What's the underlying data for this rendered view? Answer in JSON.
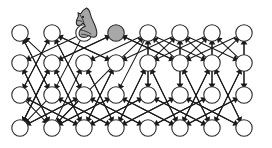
{
  "figure": {
    "name": "knight-move-graph",
    "width": 272,
    "height": 148,
    "background": "#ffffff"
  },
  "style": {
    "node_stroke": "#2a2a2a",
    "node_empty_fill": "#ffffff",
    "node_filled_fill": "#a8a8a8",
    "edge_color": "#1a1a1a",
    "piece_fill": "#a6a6a6",
    "piece_stroke": "#262626",
    "node_radius": 8.2,
    "edge_width": 1.05
  },
  "grid": {
    "columns": 8,
    "rows": 4,
    "col_x": [
      20,
      52,
      84,
      116,
      148,
      180,
      212,
      244
    ],
    "row_y": [
      33,
      63,
      95,
      128
    ]
  },
  "nodes": [
    {
      "id": "r0c0",
      "label": "",
      "col": 0,
      "row": 0,
      "cx": 20,
      "cy": 33,
      "state": "empty"
    },
    {
      "id": "r0c1",
      "label": "",
      "col": 1,
      "row": 0,
      "cx": 52,
      "cy": 33,
      "state": "empty"
    },
    {
      "id": "r0c2",
      "label": "",
      "col": 2,
      "row": 0,
      "cx": 84,
      "cy": 33,
      "state": "occupied-by-piece"
    },
    {
      "id": "r0c3",
      "label": "",
      "col": 3,
      "row": 0,
      "cx": 116,
      "cy": 33,
      "state": "filled"
    },
    {
      "id": "r0c4",
      "label": "",
      "col": 4,
      "row": 0,
      "cx": 148,
      "cy": 33,
      "state": "empty"
    },
    {
      "id": "r0c5",
      "label": "",
      "col": 5,
      "row": 0,
      "cx": 180,
      "cy": 33,
      "state": "empty"
    },
    {
      "id": "r0c6",
      "label": "",
      "col": 6,
      "row": 0,
      "cx": 212,
      "cy": 33,
      "state": "empty"
    },
    {
      "id": "r0c7",
      "label": "",
      "col": 7,
      "row": 0,
      "cx": 244,
      "cy": 33,
      "state": "empty"
    },
    {
      "id": "r1c0",
      "label": "",
      "col": 0,
      "row": 1,
      "cx": 20,
      "cy": 63,
      "state": "empty"
    },
    {
      "id": "r1c1",
      "label": "",
      "col": 1,
      "row": 1,
      "cx": 52,
      "cy": 63,
      "state": "empty"
    },
    {
      "id": "r1c2",
      "label": "",
      "col": 2,
      "row": 1,
      "cx": 84,
      "cy": 63,
      "state": "empty"
    },
    {
      "id": "r1c3",
      "label": "",
      "col": 3,
      "row": 1,
      "cx": 116,
      "cy": 63,
      "state": "empty"
    },
    {
      "id": "r1c4",
      "label": "",
      "col": 4,
      "row": 1,
      "cx": 148,
      "cy": 63,
      "state": "empty"
    },
    {
      "id": "r1c5",
      "label": "",
      "col": 5,
      "row": 1,
      "cx": 180,
      "cy": 63,
      "state": "empty"
    },
    {
      "id": "r1c6",
      "label": "",
      "col": 6,
      "row": 1,
      "cx": 212,
      "cy": 63,
      "state": "empty"
    },
    {
      "id": "r1c7",
      "label": "",
      "col": 7,
      "row": 1,
      "cx": 244,
      "cy": 63,
      "state": "empty"
    },
    {
      "id": "r2c0",
      "label": "",
      "col": 0,
      "row": 2,
      "cx": 20,
      "cy": 95,
      "state": "empty"
    },
    {
      "id": "r2c1",
      "label": "",
      "col": 1,
      "row": 2,
      "cx": 52,
      "cy": 95,
      "state": "empty"
    },
    {
      "id": "r2c2",
      "label": "",
      "col": 2,
      "row": 2,
      "cx": 84,
      "cy": 95,
      "state": "empty"
    },
    {
      "id": "r2c3",
      "label": "",
      "col": 3,
      "row": 2,
      "cx": 116,
      "cy": 95,
      "state": "empty"
    },
    {
      "id": "r2c4",
      "label": "",
      "col": 4,
      "row": 2,
      "cx": 148,
      "cy": 95,
      "state": "empty"
    },
    {
      "id": "r2c5",
      "label": "",
      "col": 5,
      "row": 2,
      "cx": 180,
      "cy": 95,
      "state": "empty"
    },
    {
      "id": "r2c6",
      "label": "",
      "col": 6,
      "row": 2,
      "cx": 212,
      "cy": 95,
      "state": "empty"
    },
    {
      "id": "r2c7",
      "label": "",
      "col": 7,
      "row": 2,
      "cx": 244,
      "cy": 95,
      "state": "empty"
    },
    {
      "id": "r3c0",
      "label": "",
      "col": 0,
      "row": 3,
      "cx": 20,
      "cy": 128,
      "state": "empty"
    },
    {
      "id": "r3c1",
      "label": "",
      "col": 1,
      "row": 3,
      "cx": 52,
      "cy": 128,
      "state": "empty"
    },
    {
      "id": "r3c2",
      "label": "",
      "col": 2,
      "row": 3,
      "cx": 84,
      "cy": 128,
      "state": "empty"
    },
    {
      "id": "r3c3",
      "label": "",
      "col": 3,
      "row": 3,
      "cx": 116,
      "cy": 128,
      "state": "empty"
    },
    {
      "id": "r3c4",
      "label": "",
      "col": 4,
      "row": 3,
      "cx": 148,
      "cy": 128,
      "state": "empty"
    },
    {
      "id": "r3c5",
      "label": "",
      "col": 5,
      "row": 3,
      "cx": 180,
      "cy": 128,
      "state": "empty"
    },
    {
      "id": "r3c6",
      "label": "",
      "col": 6,
      "row": 3,
      "cx": 212,
      "cy": 128,
      "state": "empty"
    },
    {
      "id": "r3c7",
      "label": "",
      "col": 7,
      "row": 3,
      "cx": 244,
      "cy": 128,
      "state": "empty"
    }
  ],
  "edges": [
    {
      "from": "r1c1",
      "to": "r0c0",
      "arrow": "to"
    },
    {
      "from": "r2c1",
      "to": "r0c0",
      "arrow": "to"
    },
    {
      "from": "r1c1",
      "to": "r3c0",
      "arrow": "to"
    },
    {
      "from": "r2c1",
      "to": "r3c0",
      "arrow": "to"
    },
    {
      "from": "r2c0",
      "to": "r0c1",
      "arrow": "to"
    },
    {
      "from": "r2c2",
      "to": "r0c1",
      "arrow": "to"
    },
    {
      "from": "r1c3",
      "to": "r0c1",
      "arrow": "to"
    },
    {
      "from": "r2c0",
      "to": "r3c1",
      "arrow": "to"
    },
    {
      "from": "r2c2",
      "to": "r3c1",
      "arrow": "to"
    },
    {
      "from": "r1c3",
      "to": "r3c1",
      "arrow": "to"
    },
    {
      "from": "r1c1",
      "to": "r0c3",
      "arrow": "to"
    },
    {
      "from": "r1c5",
      "to": "r0c3",
      "arrow": "to"
    },
    {
      "from": "r1c3",
      "to": "r0c4",
      "arrow": "to"
    },
    {
      "from": "r1c5",
      "to": "r0c4",
      "arrow": "to"
    },
    {
      "from": "r2c4",
      "to": "r0c4",
      "arrow": "to"
    },
    {
      "from": "r1c4",
      "to": "r0c5",
      "arrow": "to"
    },
    {
      "from": "r1c6",
      "to": "r0c5",
      "arrow": "to"
    },
    {
      "from": "r2c5",
      "to": "r0c5",
      "arrow": "to"
    },
    {
      "from": "r1c5",
      "to": "r0c6",
      "arrow": "to"
    },
    {
      "from": "r1c7",
      "to": "r0c6",
      "arrow": "to"
    },
    {
      "from": "r2c6",
      "to": "r0c6",
      "arrow": "to"
    },
    {
      "from": "r1c6",
      "to": "r0c7",
      "arrow": "to"
    },
    {
      "from": "r2c7",
      "to": "r0c7",
      "arrow": "to"
    },
    {
      "from": "r0c2",
      "to": "r1c0",
      "arrow": "to"
    },
    {
      "from": "r3c1",
      "to": "r1c0",
      "arrow": "to"
    },
    {
      "from": "r0c3",
      "to": "r1c1",
      "arrow": "to"
    },
    {
      "from": "r3c0",
      "to": "r1c1",
      "arrow": "to"
    },
    {
      "from": "r3c2",
      "to": "r1c1",
      "arrow": "to"
    },
    {
      "from": "r0c4",
      "to": "r1c2",
      "arrow": "to"
    },
    {
      "from": "r3c1",
      "to": "r1c2",
      "arrow": "to"
    },
    {
      "from": "r3c3",
      "to": "r1c2",
      "arrow": "to"
    },
    {
      "from": "r0c1",
      "to": "r1c3",
      "arrow": "to"
    },
    {
      "from": "r0c5",
      "to": "r1c3",
      "arrow": "to"
    },
    {
      "from": "r3c2",
      "to": "r1c3",
      "arrow": "to"
    },
    {
      "from": "r0c6",
      "to": "r1c4",
      "arrow": "to"
    },
    {
      "from": "r3c3",
      "to": "r1c4",
      "arrow": "to"
    },
    {
      "from": "r3c5",
      "to": "r1c4",
      "arrow": "to"
    },
    {
      "from": "r0c3",
      "to": "r1c5",
      "arrow": "to"
    },
    {
      "from": "r0c7",
      "to": "r1c5",
      "arrow": "to"
    },
    {
      "from": "r3c6",
      "to": "r1c5",
      "arrow": "to"
    },
    {
      "from": "r0c4",
      "to": "r1c6",
      "arrow": "to"
    },
    {
      "from": "r3c5",
      "to": "r1c6",
      "arrow": "to"
    },
    {
      "from": "r3c7",
      "to": "r1c6",
      "arrow": "to"
    },
    {
      "from": "r0c5",
      "to": "r1c7",
      "arrow": "to"
    },
    {
      "from": "r3c6",
      "to": "r1c7",
      "arrow": "to"
    },
    {
      "from": "r0c1",
      "to": "r2c0",
      "arrow": "to"
    },
    {
      "from": "r3c2",
      "to": "r2c0",
      "arrow": "to"
    },
    {
      "from": "r0c0",
      "to": "r2c1",
      "arrow": "to"
    },
    {
      "from": "r0c2",
      "to": "r2c1",
      "arrow": "to"
    },
    {
      "from": "r3c3",
      "to": "r2c1",
      "arrow": "to"
    },
    {
      "from": "r0c1",
      "to": "r2c2",
      "arrow": "to"
    },
    {
      "from": "r3c0",
      "to": "r2c2",
      "arrow": "to"
    },
    {
      "from": "r3c4",
      "to": "r2c2",
      "arrow": "to"
    },
    {
      "from": "r0c4",
      "to": "r2c3",
      "arrow": "to"
    },
    {
      "from": "r3c1",
      "to": "r2c3",
      "arrow": "to"
    },
    {
      "from": "r3c5",
      "to": "r2c3",
      "arrow": "to"
    },
    {
      "from": "r0c4",
      "to": "r2c4",
      "arrow": "to"
    },
    {
      "from": "r3c2",
      "to": "r2c4",
      "arrow": "to"
    },
    {
      "from": "r3c6",
      "to": "r2c4",
      "arrow": "to"
    },
    {
      "from": "r0c5",
      "to": "r2c5",
      "arrow": "to"
    },
    {
      "from": "r3c3",
      "to": "r2c5",
      "arrow": "to"
    },
    {
      "from": "r3c7",
      "to": "r2c5",
      "arrow": "to"
    },
    {
      "from": "r0c6",
      "to": "r2c6",
      "arrow": "to"
    },
    {
      "from": "r3c4",
      "to": "r2c6",
      "arrow": "to"
    },
    {
      "from": "r0c7",
      "to": "r2c7",
      "arrow": "to"
    },
    {
      "from": "r3c5",
      "to": "r2c7",
      "arrow": "to"
    },
    {
      "from": "r1c1",
      "to": "r3c0",
      "arrow": "to"
    },
    {
      "from": "r2c2",
      "to": "r3c0",
      "arrow": "to"
    },
    {
      "from": "r2c3",
      "to": "r3c1",
      "arrow": "to"
    },
    {
      "from": "r1c0",
      "to": "r3c1",
      "arrow": "to"
    },
    {
      "from": "r1c1",
      "to": "r3c2",
      "arrow": "to"
    },
    {
      "from": "r1c3",
      "to": "r3c2",
      "arrow": "to"
    },
    {
      "from": "r2c4",
      "to": "r3c2",
      "arrow": "to"
    },
    {
      "from": "r2c0",
      "to": "r3c2",
      "arrow": "to"
    },
    {
      "from": "r1c2",
      "to": "r3c3",
      "arrow": "to"
    },
    {
      "from": "r1c4",
      "to": "r3c3",
      "arrow": "to"
    },
    {
      "from": "r2c5",
      "to": "r3c3",
      "arrow": "to"
    },
    {
      "from": "r2c1",
      "to": "r3c3",
      "arrow": "to"
    },
    {
      "from": "r2c2",
      "to": "r3c4",
      "arrow": "to"
    },
    {
      "from": "r2c6",
      "to": "r3c4",
      "arrow": "to"
    },
    {
      "from": "r1c4",
      "to": "r3c5",
      "arrow": "to"
    },
    {
      "from": "r1c6",
      "to": "r3c5",
      "arrow": "to"
    },
    {
      "from": "r2c7",
      "to": "r3c5",
      "arrow": "to"
    },
    {
      "from": "r2c3",
      "to": "r3c5",
      "arrow": "to"
    },
    {
      "from": "r1c5",
      "to": "r3c6",
      "arrow": "to"
    },
    {
      "from": "r1c7",
      "to": "r3c6",
      "arrow": "to"
    },
    {
      "from": "r2c4",
      "to": "r3c6",
      "arrow": "to"
    },
    {
      "from": "r1c6",
      "to": "r3c7",
      "arrow": "to"
    },
    {
      "from": "r2c5",
      "to": "r3c7",
      "arrow": "to"
    }
  ],
  "piece": {
    "kind": "knight",
    "label": "knight-chess-piece",
    "cx": 88,
    "cy": 22,
    "at_node": "r0c2",
    "fill": "#a6a6a6",
    "stroke": "#262626"
  }
}
